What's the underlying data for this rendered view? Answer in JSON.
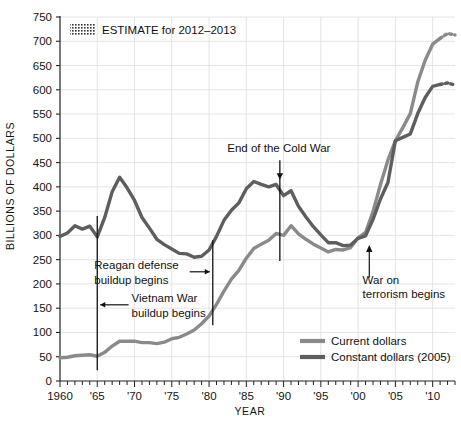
{
  "chart_data": {
    "type": "line",
    "title": "",
    "xlabel": "YEAR",
    "ylabel": "BILLIONS OF DOLLARS",
    "xlim": [
      1960,
      2013
    ],
    "ylim": [
      0,
      750
    ],
    "ytick_step": 50,
    "xtick_step": 1,
    "xlabel_step": 5,
    "grid": true,
    "legend_position": "bottom-right",
    "ytick_labels": [
      "0",
      "50",
      "100",
      "150",
      "200",
      "250",
      "300",
      "350",
      "400",
      "450",
      "500",
      "550",
      "600",
      "650",
      "700",
      "750"
    ],
    "xtick_labels": [
      "1960",
      "'65",
      "'70",
      "'75",
      "'80",
      "'85",
      "'90",
      "'95",
      "'00",
      "'05",
      "'10"
    ],
    "x": [
      1960,
      1961,
      1962,
      1963,
      1964,
      1965,
      1966,
      1967,
      1968,
      1969,
      1970,
      1971,
      1972,
      1973,
      1974,
      1975,
      1976,
      1977,
      1978,
      1979,
      1980,
      1981,
      1982,
      1983,
      1984,
      1985,
      1986,
      1987,
      1988,
      1989,
      1990,
      1991,
      1992,
      1993,
      1994,
      1995,
      1996,
      1997,
      1998,
      1999,
      2000,
      2001,
      2002,
      2003,
      2004,
      2005,
      2006,
      2007,
      2008,
      2009,
      2010,
      2011,
      2012,
      2013
    ],
    "series": [
      {
        "name": "Current dollars",
        "color": "#8a8a8a",
        "values": [
          48,
          49,
          52,
          53,
          54,
          51,
          59,
          72,
          82,
          82,
          82,
          79,
          79,
          77,
          80,
          87,
          90,
          97,
          105,
          118,
          134,
          158,
          185,
          210,
          228,
          253,
          273,
          282,
          290,
          304,
          300,
          320,
          303,
          292,
          282,
          274,
          266,
          271,
          270,
          275,
          295,
          306,
          349,
          405,
          455,
          495,
          522,
          551,
          616,
          661,
          694,
          706,
          716,
          713
        ],
        "style": "solid",
        "estimate_from": 2012
      },
      {
        "name": "Constant dollars (2005)",
        "color": "#5e5e5e",
        "values": [
          298,
          305,
          320,
          313,
          319,
          297,
          337,
          390,
          420,
          398,
          372,
          337,
          315,
          292,
          281,
          272,
          263,
          262,
          255,
          257,
          270,
          298,
          331,
          352,
          367,
          396,
          411,
          405,
          400,
          405,
          382,
          392,
          360,
          338,
          318,
          301,
          285,
          285,
          279,
          280,
          294,
          299,
          333,
          375,
          409,
          495,
          502,
          509,
          551,
          584,
          607,
          611,
          614,
          610
        ],
        "style": "solid",
        "estimate_from": 2012
      }
    ],
    "annotations": [
      {
        "id": "vietnam-war-buildup",
        "label": "Vietnam War\nbuildup begins",
        "line1": "Vietnam War",
        "line2": "buildup begins",
        "year": 1965,
        "marker": "vertical-line-with-arrow"
      },
      {
        "id": "reagan-defense-buildup",
        "label": "Reagan defense\nbuildup begins",
        "line1": "Reagan defense",
        "line2": "buildup begins",
        "year": 1980.5,
        "marker": "vertical-line-with-arrow"
      },
      {
        "id": "end-of-cold-war",
        "label": "End of the Cold War",
        "line1": "End of the Cold War",
        "line2": "",
        "year": 1989.5,
        "marker": "vertical-line-with-arrow"
      },
      {
        "id": "war-on-terrorism",
        "label": "War on\nterrorism begins",
        "line1": "War on",
        "line2": "terrorism begins",
        "year": 2001.5,
        "marker": "up-arrow"
      }
    ],
    "estimate_note": "ESTIMATE for 2012–2013",
    "estimate_swatch": "hatched-dotted"
  },
  "legend": {
    "items": [
      {
        "label": "Current dollars",
        "color": "#8a8a8a"
      },
      {
        "label": "Constant dollars (2005)",
        "color": "#5e5e5e"
      }
    ]
  },
  "axis": {
    "y_title": "BILLIONS OF DOLLARS",
    "x_title": "YEAR"
  },
  "colors": {
    "grid": "#dddddd",
    "axis": "#222222",
    "text": "#141414",
    "current_dollars": "#8a8a8a",
    "constant_dollars": "#5e5e5e",
    "background": "#ffffff"
  }
}
